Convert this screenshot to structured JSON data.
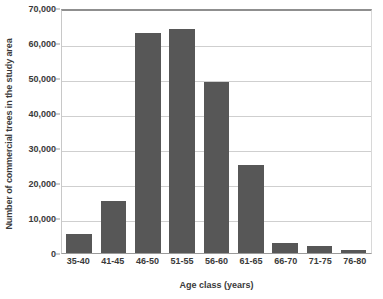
{
  "chart_data": {
    "type": "bar",
    "title": "",
    "xlabel": "Age class (years)",
    "ylabel": "Number of commercial trees in the study area",
    "categories": [
      "35-40",
      "41-45",
      "46-50",
      "51-55",
      "56-60",
      "61-65",
      "66-70",
      "71-75",
      "76-80"
    ],
    "values": [
      5500,
      15000,
      63000,
      64000,
      49000,
      25200,
      3000,
      2100,
      800
    ],
    "ylim": [
      0,
      70000
    ],
    "ytick_values": [
      0,
      10000,
      20000,
      30000,
      40000,
      50000,
      60000,
      70000
    ],
    "ytick_labels": [
      "0",
      "10,000",
      "20,000",
      "30,000",
      "40,000",
      "50,000",
      "60,000",
      "70,000"
    ],
    "grid": true,
    "legend": false,
    "bar_color": "#575757",
    "gridline_color": "#cfcfcf",
    "axis_color": "#9a9a9a",
    "text_color": "#3a3a3a"
  }
}
